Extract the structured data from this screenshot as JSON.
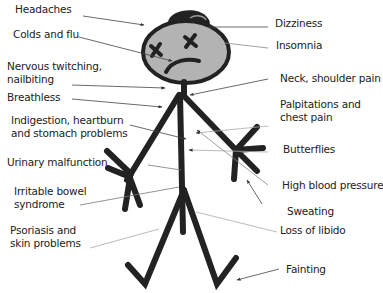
{
  "diagram": {
    "type": "annotated-illustration",
    "colors": {
      "ink": "#222222",
      "head_fill": "#b3b3b3",
      "leader_line": "#555555",
      "leader_line_light": "#aaaaaa",
      "background": "#ffffff"
    },
    "labels_left": [
      {
        "id": "headaches",
        "lines": [
          "Headaches"
        ]
      },
      {
        "id": "colds",
        "lines": [
          "Colds and flu"
        ]
      },
      {
        "id": "twitching",
        "lines": [
          "Nervous twitching,",
          "nailbiting"
        ]
      },
      {
        "id": "breathless",
        "lines": [
          "Breathless"
        ]
      },
      {
        "id": "indigestion",
        "lines": [
          "Indigestion, heartburn",
          "and stomach problems"
        ]
      },
      {
        "id": "urinary",
        "lines": [
          "Urinary malfunction"
        ]
      },
      {
        "id": "ibs",
        "lines": [
          "Irritable bowel",
          "syndrome"
        ]
      },
      {
        "id": "psoriasis",
        "lines": [
          "Psoriasis and",
          "skin problems"
        ]
      }
    ],
    "labels_right": [
      {
        "id": "dizziness",
        "lines": [
          "Dizziness"
        ]
      },
      {
        "id": "insomnia",
        "lines": [
          "Insomnia"
        ]
      },
      {
        "id": "neck",
        "lines": [
          "Neck, shoulder pain"
        ]
      },
      {
        "id": "palpitations",
        "lines": [
          "Palpitations and",
          "chest pain"
        ]
      },
      {
        "id": "butterflies",
        "lines": [
          "Butterflies"
        ]
      },
      {
        "id": "bp",
        "lines": [
          "High blood pressure"
        ]
      },
      {
        "id": "sweating",
        "lines": [
          "Sweating"
        ]
      },
      {
        "id": "libido",
        "lines": [
          "Loss of libido"
        ]
      },
      {
        "id": "fainting",
        "lines": [
          "Fainting"
        ]
      }
    ]
  }
}
